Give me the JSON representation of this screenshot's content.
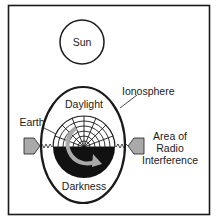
{
  "diagram": {
    "labels": {
      "sun": "Sun",
      "ionosphere": "Ionosphere",
      "daylight": "Daylight",
      "earth": "Earth",
      "darkness": "Darkness",
      "interference_line1": "Area of",
      "interference_line2": "Radio",
      "interference_line3": "Interference"
    },
    "colors": {
      "stroke": "#1a1a1a",
      "arrow_fill": "#a9a9a9",
      "night_fill": "#111111",
      "background": "#ffffff"
    }
  }
}
